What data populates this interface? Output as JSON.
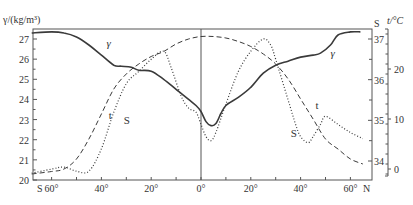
{
  "chart_data": {
    "type": "line",
    "title": "",
    "xlabel": "Latitude",
    "x_ticks": [
      "60°",
      "40°",
      "20°",
      "0°",
      "20°",
      "40°",
      "60°"
    ],
    "x_tick_values": [
      -60,
      -40,
      -20,
      0,
      20,
      40,
      60
    ],
    "x_end_labels": {
      "left": "S",
      "right": "N"
    },
    "xlim": [
      -68,
      68
    ],
    "axes": {
      "left": {
        "label": "γ/(kg/m³)",
        "ticks": [
          "20",
          "21",
          "22",
          "23",
          "24",
          "25",
          "26",
          "27"
        ],
        "range": [
          20,
          27.4
        ]
      },
      "right_inner": {
        "label": "S",
        "ticks": [
          "34",
          "35",
          "36",
          "37"
        ],
        "range": [
          33.5,
          37.2
        ]
      },
      "right_outer": {
        "label": "t/°C",
        "ticks": [
          "0",
          "10",
          "20"
        ],
        "range": [
          -2,
          32
        ]
      }
    },
    "series": [
      {
        "name": "γ",
        "style": "solid",
        "axis": "left",
        "x": [
          -68,
          -60,
          -55,
          -50,
          -45,
          -40,
          -35,
          -32,
          -28,
          -25,
          -20,
          -15,
          -10,
          -5,
          -2,
          0,
          2,
          4,
          6,
          8,
          10,
          15,
          20,
          25,
          30,
          35,
          40,
          45,
          48,
          52,
          55,
          60,
          64
        ],
        "values": [
          27.3,
          27.35,
          27.3,
          27.1,
          26.7,
          26.2,
          25.7,
          25.65,
          25.6,
          25.45,
          25.4,
          25.0,
          24.5,
          24.0,
          23.7,
          23.4,
          22.9,
          22.7,
          22.8,
          23.3,
          23.7,
          24.1,
          24.6,
          25.3,
          25.7,
          25.9,
          26.1,
          26.2,
          26.3,
          26.7,
          27.2,
          27.35,
          27.35
        ],
        "label_positions": [
          {
            "x": -38,
            "y": 26.6
          },
          {
            "x": 52,
            "y": 26.1
          }
        ]
      },
      {
        "name": "t",
        "style": "dashed",
        "axis": "right_outer",
        "x": [
          -68,
          -60,
          -55,
          -50,
          -45,
          -40,
          -35,
          -30,
          -25,
          -20,
          -15,
          -10,
          -5,
          0,
          5,
          10,
          15,
          20,
          25,
          30,
          35,
          40,
          45,
          50,
          55,
          60,
          65
        ],
        "values": [
          -1,
          -0.5,
          0,
          2,
          6,
          11,
          16,
          19,
          21,
          22.5,
          23.5,
          25,
          26,
          26.5,
          26.5,
          26.2,
          25.5,
          24.5,
          23,
          21,
          18,
          14,
          10,
          6,
          4,
          2,
          1
        ],
        "label_positions": [
          {
            "x": -37,
            "y": 10
          },
          {
            "x": 46,
            "y": 12
          }
        ]
      },
      {
        "name": "S",
        "style": "dotted",
        "axis": "right_inner",
        "x": [
          -68,
          -60,
          -55,
          -50,
          -45,
          -40,
          -35,
          -30,
          -25,
          -20,
          -15,
          -12,
          -8,
          -5,
          -2,
          0,
          2,
          4,
          6,
          10,
          15,
          20,
          25,
          28,
          30,
          35,
          38,
          40,
          43,
          45,
          48,
          50,
          55,
          60,
          65
        ],
        "values": [
          33.7,
          33.8,
          33.85,
          33.75,
          33.75,
          34.3,
          35.2,
          35.9,
          36.2,
          36.5,
          36.7,
          36.3,
          35.6,
          35.3,
          35.2,
          34.9,
          34.6,
          34.5,
          34.7,
          35.4,
          36.2,
          36.7,
          37.0,
          36.85,
          36.5,
          35.5,
          34.9,
          34.6,
          34.45,
          34.6,
          34.9,
          35.1,
          34.9,
          34.7,
          34.55
        ],
        "label_positions": [
          {
            "x": -31,
            "y": 34.9
          },
          {
            "x": 36,
            "y": 34.6
          }
        ]
      }
    ],
    "grid": false,
    "legend": "inline curve labels (γ, t, S)"
  }
}
